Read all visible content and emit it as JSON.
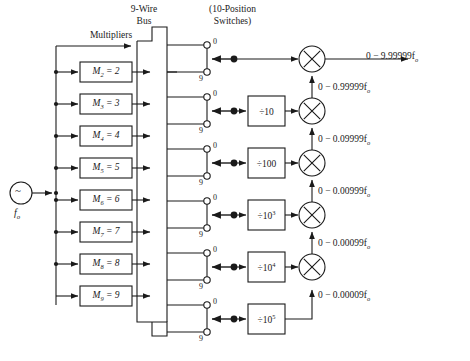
{
  "figure": {
    "headers": {
      "multipliers": "Multipliers",
      "bus_line1": "9-Wire",
      "bus_line2": "Bus",
      "switches_line1": "(10-Position",
      "switches_line2": "Switches)"
    },
    "source": {
      "symbol": "~",
      "label": "f",
      "label_sub": "o",
      "name": "oscillator-source"
    },
    "multipliers": [
      {
        "m": "M",
        "sub": "2",
        "eq": "= 2",
        "text": "M2 = 2"
      },
      {
        "m": "M",
        "sub": "3",
        "eq": "= 3",
        "text": "M3 = 3"
      },
      {
        "m": "M",
        "sub": "4",
        "eq": "= 4",
        "text": "M4 = 4"
      },
      {
        "m": "M",
        "sub": "5",
        "eq": "= 5",
        "text": "M5 = 5"
      },
      {
        "m": "M",
        "sub": "6",
        "eq": "= 6",
        "text": "M6 = 6"
      },
      {
        "m": "M",
        "sub": "7",
        "eq": "= 7",
        "text": "M7 = 7"
      },
      {
        "m": "M",
        "sub": "8",
        "eq": "= 8",
        "text": "M8 = 8"
      },
      {
        "m": "M",
        "sub": "9",
        "eq": "= 9",
        "text": "M9 = 9"
      }
    ],
    "switch_terminals": {
      "top": "0",
      "bottom": "9",
      "count": 6
    },
    "dividers": [
      {
        "text": "÷10",
        "base": "÷10",
        "exp": ""
      },
      {
        "text": "÷100",
        "base": "÷100",
        "exp": ""
      },
      {
        "text": "÷10³",
        "base": "÷10",
        "exp": "3"
      },
      {
        "text": "÷10⁴",
        "base": "÷10",
        "exp": "4"
      },
      {
        "text": "÷10⁵",
        "base": "÷10",
        "exp": "5"
      }
    ],
    "signal_labels": [
      {
        "text": "0 − 9.99999f",
        "sub": "o",
        "full": "0 - 9.99999fo"
      },
      {
        "text": "0 − 0.99999f",
        "sub": "o",
        "full": "0 - 0.99999fo"
      },
      {
        "text": "0 − 0.09999f",
        "sub": "o",
        "full": "0 - 0.09999fo"
      },
      {
        "text": "0 − 0.00999f",
        "sub": "o",
        "full": "0 - 0.00999fo"
      },
      {
        "text": "0 − 0.00099f",
        "sub": "o",
        "full": "0 - 0.00099fo"
      },
      {
        "text": "0 − 0.00009f",
        "sub": "o",
        "full": "0 - 0.00009fo"
      }
    ],
    "mixer_count": 5,
    "colors": {
      "line": "#1a1a1a",
      "text": "#1a1a1a",
      "background": "#ffffff"
    }
  }
}
